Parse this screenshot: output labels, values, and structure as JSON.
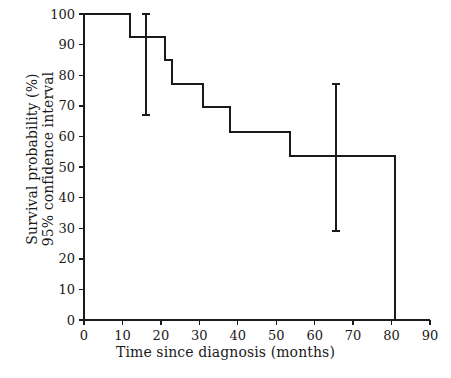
{
  "chart_data": {
    "type": "line",
    "subtype": "kaplan-meier-step",
    "title": "",
    "xlabel": "Time since diagnosis (months)",
    "ylabel": "Survival probability (%)\n95% confidence interval",
    "ylabel_lines": [
      "Survival probability (%)",
      "95% confidence interval"
    ],
    "xlim": [
      0,
      90
    ],
    "ylim": [
      0,
      100
    ],
    "xticks": [
      0,
      10,
      20,
      30,
      40,
      50,
      60,
      70,
      80,
      90
    ],
    "yticks": [
      0,
      10,
      20,
      30,
      40,
      50,
      60,
      70,
      80,
      90,
      100
    ],
    "xticklabels": [
      "0",
      "10",
      "20",
      "30",
      "40",
      "50",
      "60",
      "70",
      "80",
      "90"
    ],
    "yticklabels": [
      "0",
      "10",
      "20",
      "30",
      "40",
      "50",
      "60",
      "70",
      "80",
      "90",
      "100"
    ],
    "grid": false,
    "legend": false,
    "line_color": "#1a1a1a",
    "line_width": 2,
    "series": [
      {
        "name": "Survival probability",
        "step": "post",
        "x": [
          0,
          12,
          12,
          21,
          21,
          23,
          23,
          31,
          31,
          38,
          38,
          53.5,
          53.5,
          81,
          81
        ],
        "y": [
          100,
          100,
          92.5,
          92.5,
          85,
          85,
          77,
          77,
          69.5,
          69.5,
          61.5,
          61.5,
          53.5,
          53.5,
          0
        ],
        "drops": [
          {
            "time": 12,
            "from": 100,
            "to": 92.5
          },
          {
            "time": 21,
            "from": 92.5,
            "to": 85
          },
          {
            "time": 23,
            "from": 85,
            "to": 77
          },
          {
            "time": 31,
            "from": 77,
            "to": 69.5
          },
          {
            "time": 38,
            "from": 69.5,
            "to": 61.5
          },
          {
            "time": 53.5,
            "from": 61.5,
            "to": 53.5
          },
          {
            "time": 81,
            "from": 53.5,
            "to": 0
          }
        ]
      }
    ],
    "error_bars": [
      {
        "x": 16,
        "y": 92.5,
        "lower": 67,
        "upper": 100
      },
      {
        "x": 65.5,
        "y": 53.5,
        "lower": 29,
        "upper": 77
      }
    ]
  },
  "axes": {
    "x_axis_name": "time-axis",
    "y_axis_name": "survival-axis"
  }
}
